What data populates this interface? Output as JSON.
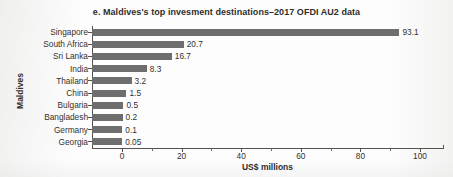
{
  "chart_data": {
    "type": "bar",
    "orientation": "horizontal",
    "title": "e. Maldives's top invesment destinations–2017 OFDI AU2 data",
    "xlabel": "US$ millions",
    "ylabel": "Maldives",
    "categories": [
      "Singapore",
      "South Africa",
      "Sri Lanka",
      "India",
      "Thailand",
      "China",
      "Bulgaria",
      "Bangladesh",
      "Germany",
      "Georgia"
    ],
    "values": [
      93.1,
      20.7,
      16.7,
      8.3,
      3.2,
      1.5,
      0.5,
      0.2,
      0.1,
      0.05
    ],
    "value_labels": [
      "93.1",
      "20.7",
      "16.7",
      "8.3",
      "3.2",
      "1.5",
      "0.5",
      "0.2",
      "0.1",
      "0.05"
    ],
    "xlim": [
      -10,
      108
    ],
    "xticks": [
      0,
      20,
      40,
      60,
      80,
      100
    ],
    "xtick_labels": [
      "0",
      "20",
      "40",
      "60",
      "80",
      "100"
    ],
    "xticks_minor": [
      10,
      30,
      50,
      70,
      90
    ],
    "grid": false,
    "legend": "none",
    "bar_color": "#6e6e6e",
    "axis_color": "#55524f",
    "text_color": "#33312f"
  }
}
